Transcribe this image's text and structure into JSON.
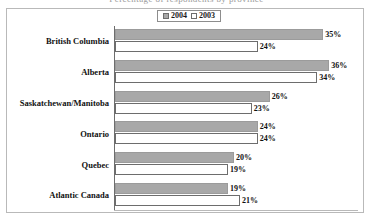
{
  "title_clipped": "Percentage of respondents by province",
  "legend": {
    "items": [
      {
        "label": "2004",
        "swatch": "filled-gray-swatch-icon"
      },
      {
        "label": "2003",
        "swatch": "empty-white-swatch-icon"
      }
    ]
  },
  "colors": {
    "series_2004_fill": "#a8a8a8",
    "series_2003_fill": "#ffffff",
    "bar_outline": "#6d6d6d",
    "frame": "#b9b9b9",
    "text": "#111111",
    "background": "#ffffff"
  },
  "chart_data": {
    "type": "bar",
    "orientation": "horizontal",
    "title": "",
    "xlabel": "",
    "ylabel": "",
    "grid": false,
    "legend_position": "top-center",
    "xlim": [
      0,
      40
    ],
    "value_suffix": "%",
    "categories": [
      "British Columbia",
      "Alberta",
      "Saskatchewan/Manitoba",
      "Ontario",
      "Quebec",
      "Atlantic Canada"
    ],
    "series": [
      {
        "name": "2004",
        "values": [
          35,
          36,
          26,
          24,
          20,
          19
        ]
      },
      {
        "name": "2003",
        "values": [
          24,
          34,
          23,
          24,
          19,
          21
        ]
      }
    ],
    "data_labels": [
      {
        "category": "British Columbia",
        "v2004": "35%",
        "v2003": "24%"
      },
      {
        "category": "Alberta",
        "v2004": "36%",
        "v2003": "34%"
      },
      {
        "category": "Saskatchewan/Manitoba",
        "v2004": "26%",
        "v2003": "23%"
      },
      {
        "category": "Ontario",
        "v2004": "24%",
        "v2003": "24%"
      },
      {
        "category": "Quebec",
        "v2004": "20%",
        "v2003": "19%"
      },
      {
        "category": "Atlantic Canada",
        "v2004": "19%",
        "v2003": "21%"
      }
    ]
  }
}
